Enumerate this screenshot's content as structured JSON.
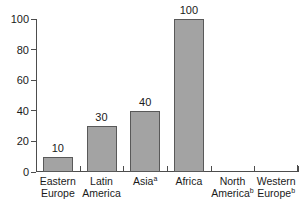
{
  "chart_data": {
    "type": "bar",
    "title": "",
    "subtitle": "",
    "xlabel": "",
    "ylabel": "",
    "ylim": [
      0,
      100
    ],
    "yticks": [
      0,
      20,
      40,
      60,
      80,
      100
    ],
    "grid": false,
    "legend": null,
    "categories": [
      "Eastern Europe",
      "Latin America",
      "Asia",
      "Africa",
      "North America",
      "Western Europe"
    ],
    "category_lines": [
      [
        "Eastern",
        "Europe"
      ],
      [
        "Latin",
        "America"
      ],
      [
        "Asia",
        ""
      ],
      [
        "Africa",
        ""
      ],
      [
        "North",
        "America"
      ],
      [
        "Western",
        "Europe"
      ]
    ],
    "category_footnotes": [
      "",
      "",
      "a",
      "",
      "b",
      "b"
    ],
    "values": [
      10,
      30,
      40,
      100,
      0,
      0
    ],
    "value_labels": [
      "10",
      "30",
      "40",
      "100",
      "",
      ""
    ],
    "bar_fill_color": "#a3a3a3",
    "bar_border_color": "#595959",
    "axis_color": "#4d4d4d",
    "text_color": "#1a1a1a",
    "background_color": "#ffffff"
  }
}
